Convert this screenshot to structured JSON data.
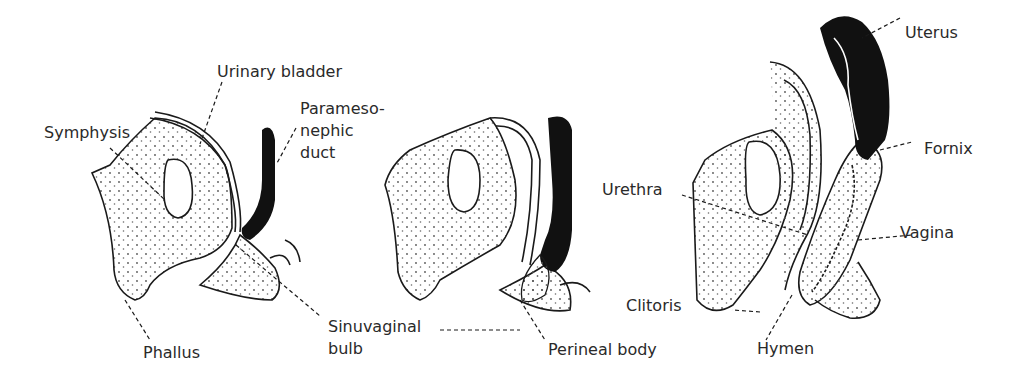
{
  "figure": {
    "panels": [
      {
        "id": "stage-1",
        "labels": {
          "urinary_bladder": "Urinary bladder",
          "symphysis": "Symphysis",
          "paramesonephric_duct_1": "Parameso-",
          "paramesonephric_duct_2": "nephic",
          "paramesonephric_duct_3": "duct",
          "phallus": "Phallus",
          "sinuvaginal_bulb_1": "Sinuvaginal",
          "sinuvaginal_bulb_2": "bulb"
        }
      },
      {
        "id": "stage-2",
        "labels": {
          "perineal_body": "Perineal body"
        }
      },
      {
        "id": "stage-3",
        "labels": {
          "uterus": "Uterus",
          "fornix": "Fornix",
          "urethra": "Urethra",
          "vagina": "Vagina",
          "clitoris": "Clitoris",
          "hymen": "Hymen"
        }
      }
    ],
    "colors": {
      "ink": "#1a1a1a",
      "duct_fill": "#111111",
      "stipple": "#555555",
      "background": "#ffffff"
    }
  }
}
